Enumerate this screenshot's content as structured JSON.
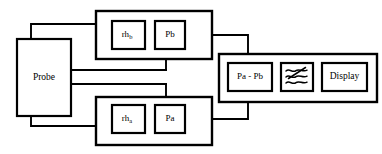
{
  "diagram": {
    "background_color": "#ffffff",
    "line_color": "#000000",
    "blocks": {
      "probe": {
        "label": "Probe"
      },
      "rh_b": {
        "label": "rh",
        "subscript": "b"
      },
      "pb": {
        "label": "Pb"
      },
      "rh_a": {
        "label": "rh",
        "subscript": "a"
      },
      "pa": {
        "label": "Pa"
      },
      "difference": {
        "label": "Pa - Pb"
      },
      "filter": {
        "label": "",
        "icon": "filter-wave-icon"
      },
      "display": {
        "label": "Display"
      }
    },
    "groups": {
      "upper_channel": {
        "name": "upper-channel-group"
      },
      "lower_channel": {
        "name": "lower-channel-group"
      },
      "processing": {
        "name": "processing-group"
      }
    }
  }
}
